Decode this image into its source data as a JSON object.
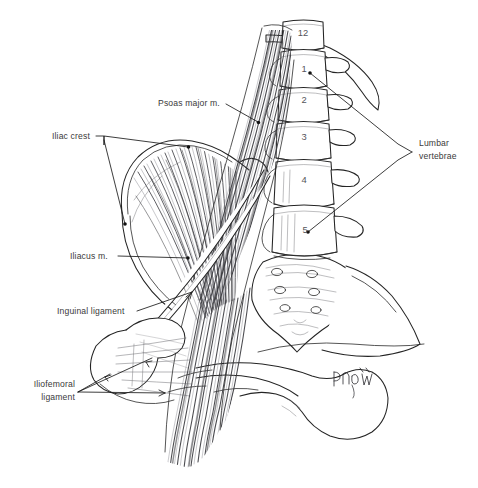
{
  "figure": {
    "background_color": "#ffffff",
    "ink_color": "#242424",
    "label_color": "#3a3a3a",
    "width": 478,
    "height": 488
  },
  "labels": [
    {
      "id": "psoas-major",
      "text": "Psoas major m.",
      "lines": [
        "Psoas major m."
      ],
      "x": 158,
      "y": 106,
      "anchor": "start"
    },
    {
      "id": "iliac-crest",
      "text": "Iliac crest",
      "lines": [
        "Iliac crest"
      ],
      "x": 52,
      "y": 139,
      "anchor": "start"
    },
    {
      "id": "lumbar-vertebrae",
      "text": "Lumbar vertebrae",
      "lines": [
        "Lumbar",
        "vertebrae"
      ],
      "x": 419,
      "y": 146,
      "anchor": "start"
    },
    {
      "id": "iliacus",
      "text": "Iliacus m.",
      "lines": [
        "Iliacus m."
      ],
      "x": 70,
      "y": 259,
      "anchor": "start"
    },
    {
      "id": "inguinal-ligament",
      "text": "Inguinal ligament",
      "lines": [
        "Inguinal ligament"
      ],
      "x": 57,
      "y": 314,
      "anchor": "start"
    },
    {
      "id": "iliofemoral-ligament",
      "text": "Iliofemoral ligament",
      "lines": [
        "Iliofemoral",
        "ligament"
      ],
      "x": 75,
      "y": 387,
      "anchor": "end"
    }
  ],
  "vertebrae": [
    {
      "number": "12",
      "x": 303,
      "y": 36,
      "region": "thoracic"
    },
    {
      "number": "1",
      "x": 304,
      "y": 72,
      "region": "lumbar"
    },
    {
      "number": "2",
      "x": 304,
      "y": 103,
      "region": "lumbar"
    },
    {
      "number": "3",
      "x": 304,
      "y": 140,
      "region": "lumbar"
    },
    {
      "number": "4",
      "x": 304,
      "y": 183,
      "region": "lumbar"
    },
    {
      "number": "5",
      "x": 305,
      "y": 233,
      "region": "lumbar"
    }
  ],
  "signature": {
    "present": true,
    "text": "",
    "x": 338,
    "y": 382,
    "description": "artist cursive signature, illegible"
  },
  "structures": [
    {
      "name": "psoas-major-muscle",
      "type": "muscle"
    },
    {
      "name": "iliacus-muscle",
      "type": "muscle"
    },
    {
      "name": "lumbar-spine",
      "type": "bone"
    },
    {
      "name": "sacrum",
      "type": "bone"
    },
    {
      "name": "ilium",
      "type": "bone"
    },
    {
      "name": "pubis",
      "type": "bone"
    },
    {
      "name": "twelfth-rib",
      "type": "bone"
    },
    {
      "name": "femur-head",
      "type": "bone"
    },
    {
      "name": "inguinal-ligament",
      "type": "ligament"
    },
    {
      "name": "iliofemoral-ligament",
      "type": "ligament"
    }
  ]
}
